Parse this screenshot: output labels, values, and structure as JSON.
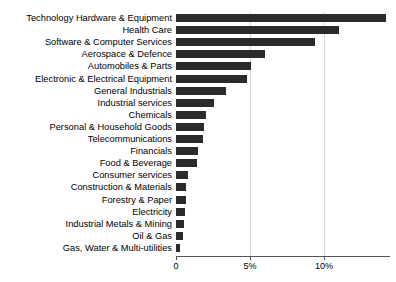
{
  "chart_data": {
    "type": "bar",
    "orientation": "horizontal",
    "title": "",
    "xlabel": "",
    "ylabel": "",
    "xlim": [
      0,
      14.45
    ],
    "grid": true,
    "legend": null,
    "xticks": [
      {
        "value": 0,
        "label": "0"
      },
      {
        "value": 5,
        "label": "5%"
      },
      {
        "value": 10,
        "label": "10%"
      }
    ],
    "categories": [
      "Technology Hardware & Equipment",
      "Health Care",
      "Software & Computer Services",
      "Aerospace & Defence",
      "Automobiles & Parts",
      "Electronic & Electrical Equipment",
      "General Industrials",
      "Industrial services",
      "Chemicals",
      "Personal & Household Goods",
      "Telecommunications",
      "Financials",
      "Food & Beverage",
      "Consumer services",
      "Construction & Materials",
      "Forestry & Paper",
      "Electricity",
      "Industrial Metals & Mining",
      "Oil & Gas",
      "Gas, Water & Multi-utilities"
    ],
    "values": [
      14.2,
      11.0,
      9.4,
      6.0,
      5.1,
      4.8,
      3.4,
      2.6,
      2.0,
      1.9,
      1.8,
      1.5,
      1.4,
      0.8,
      0.7,
      0.65,
      0.6,
      0.55,
      0.5,
      0.3
    ],
    "colors": {
      "bar": "#2b2b2b",
      "grid": "#d8d8d8",
      "axis": "#555555",
      "text": "#000000",
      "background": "#ffffff"
    }
  }
}
